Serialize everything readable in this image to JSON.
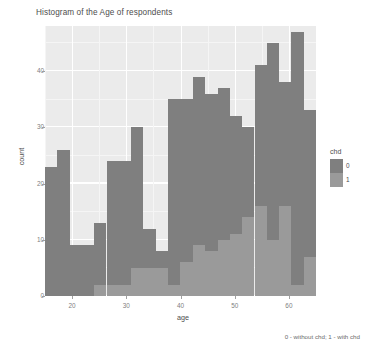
{
  "chart_data": {
    "type": "bar",
    "title": "Histogram of the Age of respondents",
    "subtitle": "",
    "xlabel": "age",
    "ylabel": "count",
    "caption": "0 - without chd; 1 - with chd",
    "stacked": true,
    "grid": true,
    "legend_position": "right",
    "legend_title": "chd",
    "xlim": [
      15,
      65
    ],
    "ylim": [
      0,
      48
    ],
    "xticks": [
      20,
      30,
      40,
      50,
      60
    ],
    "yticks": [
      0,
      10,
      20,
      30,
      40
    ],
    "bin_width": 2.27,
    "bin_centers": [
      16.1,
      18.4,
      20.7,
      22.9,
      25.2,
      27.5,
      29.8,
      32.0,
      34.3,
      36.6,
      38.9,
      41.1,
      43.4,
      45.7,
      48.0,
      50.2,
      52.5,
      54.8,
      57.1,
      59.3,
      61.6,
      63.9
    ],
    "series": [
      {
        "name": "0",
        "label": "0",
        "color": "#7f7f7f",
        "values": [
          23,
          26,
          9,
          9,
          11,
          22,
          22,
          25,
          7,
          3,
          33,
          29,
          30,
          28,
          27,
          21,
          16,
          25,
          35,
          22,
          45,
          26
        ]
      },
      {
        "name": "1",
        "label": "1",
        "color": "#9a9a9a",
        "values": [
          0,
          0,
          0,
          0,
          2,
          2,
          2,
          5,
          5,
          5,
          2,
          6,
          9,
          8,
          10,
          11,
          14,
          16,
          10,
          16,
          2,
          7
        ]
      }
    ],
    "totals": [
      23,
      26,
      9,
      9,
      13,
      24,
      24,
      30,
      12,
      8,
      35,
      35,
      39,
      36,
      37,
      32,
      30,
      41,
      45,
      38,
      47,
      33
    ]
  },
  "legend": {
    "title": "chd",
    "items": [
      {
        "label": "0",
        "color": "#7f7f7f"
      },
      {
        "label": "1",
        "color": "#9a9a9a"
      }
    ]
  },
  "colors": {
    "panel_background": "#ebebeb",
    "grid_major": "#ffffff",
    "grid_minor": "#f5f5f5",
    "series_0": "#7f7f7f",
    "series_1": "#9a9a9a",
    "text": "#4d4d4d",
    "tick_text": "#808080"
  }
}
